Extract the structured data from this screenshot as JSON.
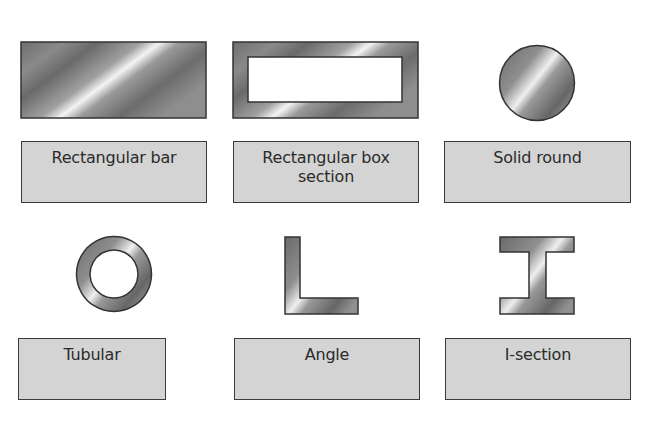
{
  "diagram": {
    "colors": {
      "label_fill": "#d4d4d4",
      "label_border": "#3a3a3a",
      "metal_dark": "#5a5a5a",
      "metal_mid": "#8c8c8c",
      "metal_light": "#f2f2f2",
      "outline": "#333333"
    },
    "items": [
      {
        "id": "rectangular-bar",
        "shape": "rectangle",
        "label": "Rectangular bar"
      },
      {
        "id": "rectangular-box-section",
        "shape": "hollow-rectangle",
        "label_line1": "Rectangular box",
        "label_line2": "section"
      },
      {
        "id": "solid-round",
        "shape": "circle",
        "label": "Solid round"
      },
      {
        "id": "tubular",
        "shape": "ring",
        "label": "Tubular"
      },
      {
        "id": "angle",
        "shape": "L-profile",
        "label": "Angle"
      },
      {
        "id": "i-section",
        "shape": "I-profile",
        "label": "I-section"
      }
    ]
  }
}
